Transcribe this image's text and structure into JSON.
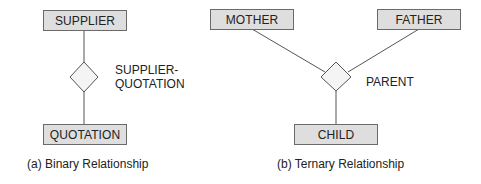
{
  "diagrams": {
    "binary": {
      "entities": [
        {
          "label": "SUPPLIER"
        },
        {
          "label": "QUOTATION"
        }
      ],
      "relationship": {
        "label_line1": "SUPPLIER-",
        "label_line2": "QUOTATION"
      },
      "caption": "(a) Binary Relationship"
    },
    "ternary": {
      "entities": [
        {
          "label": "MOTHER"
        },
        {
          "label": "FATHER"
        },
        {
          "label": "CHILD"
        }
      ],
      "relationship": {
        "label": "PARENT"
      },
      "caption": "(b) Ternary Relationship"
    }
  },
  "colors": {
    "entity_fill": "#dedede",
    "entity_border": "#6a6a6a",
    "line": "#555555",
    "diamond_fill": "#f4f4f4",
    "text": "#222222"
  }
}
